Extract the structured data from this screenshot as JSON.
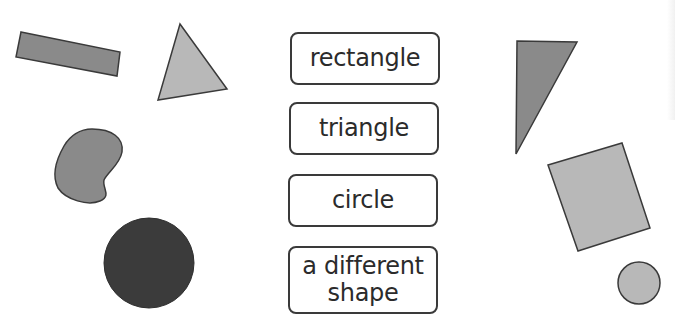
{
  "labels": [
    {
      "id": "rectangle",
      "lines": [
        "rectangle"
      ]
    },
    {
      "id": "triangle",
      "lines": [
        "triangle"
      ]
    },
    {
      "id": "circle",
      "lines": [
        "circle"
      ]
    },
    {
      "id": "different",
      "lines": [
        "a different",
        "shape"
      ]
    }
  ],
  "colors": {
    "outline": "#3a3a3a",
    "mid_grey": "#8a8a8a",
    "light_grey": "#b8b8b8",
    "dark": "#3b3b3b"
  }
}
